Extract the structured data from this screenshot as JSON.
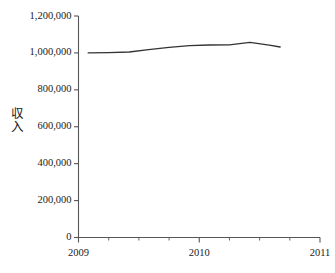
{
  "chart_data": {
    "type": "line",
    "title": "",
    "xlabel": "",
    "ylabel": "収入",
    "ylabel_chars": [
      "収",
      "入"
    ],
    "xlim": [
      2009.0,
      2011.0
    ],
    "ylim": [
      0,
      1200000
    ],
    "grid": false,
    "legend": false,
    "line_color": "#333333",
    "axis_color": "#555555",
    "y_ticks": [
      0,
      200000,
      400000,
      600000,
      800000,
      1000000,
      1200000
    ],
    "y_tick_labels": [
      "0",
      "200,000",
      "400,000",
      "600,000",
      "800,000",
      "1,000,000",
      "1,200,000"
    ],
    "x_ticks": [
      2009,
      2010,
      2011
    ],
    "x_tick_labels": [
      "2009",
      "2010",
      "2011"
    ],
    "x_minor_ticks": [
      2009.25,
      2009.5,
      2009.75,
      2010.25,
      2010.5,
      2010.75
    ],
    "series": [
      {
        "name": "収入",
        "x": [
          2009.08,
          2009.25,
          2009.42,
          2009.58,
          2009.75,
          2009.92,
          2010.08,
          2010.25,
          2010.42,
          2010.58,
          2010.67
        ],
        "values": [
          1000000,
          1002000,
          1005000,
          1018000,
          1030000,
          1040000,
          1043000,
          1044000,
          1057000,
          1042000,
          1032000
        ]
      }
    ]
  }
}
